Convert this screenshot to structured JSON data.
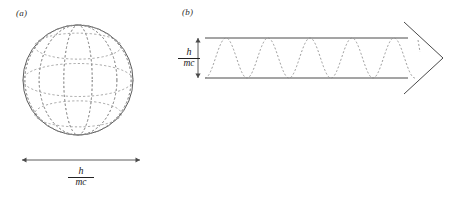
{
  "figure": {
    "width": 461,
    "height": 199,
    "background": "#ffffff",
    "stroke_solid": "#4a4a4a",
    "stroke_dashed": "#8a8a8a"
  },
  "panel_a": {
    "label": "(a)",
    "sphere": {
      "center_x": 78,
      "center_y": 80,
      "radius": 55,
      "meridian_count": 6,
      "parallel_count": 3,
      "outline_style": "solid",
      "grid_style": "dashed"
    },
    "measure": {
      "orientation": "horizontal",
      "x1": 22,
      "x2": 140,
      "y": 160,
      "arrowheads": "both",
      "label_numerator": "h",
      "label_denominator": "mc"
    }
  },
  "panel_b": {
    "label": "(b)",
    "band": {
      "x_start": 205,
      "x_end": 408,
      "y_top": 38,
      "y_bottom": 78,
      "line_style": "solid"
    },
    "arrowhead": {
      "tip_x": 443,
      "tip_y": 58,
      "base_x": 404,
      "top_y": 22,
      "bottom_y": 94,
      "style": "chevron"
    },
    "wave": {
      "style": "dashed",
      "periods": 5,
      "amplitude_fills_band": true,
      "x_start": 205,
      "x_end": 415
    },
    "measure": {
      "orientation": "vertical",
      "x": 198,
      "y1": 38,
      "y2": 78,
      "arrowheads": "both",
      "label_numerator": "h",
      "label_denominator": "mc"
    },
    "tick_mark": {
      "x": 418,
      "y1": 40,
      "y2": 52,
      "style": "dashed"
    }
  }
}
